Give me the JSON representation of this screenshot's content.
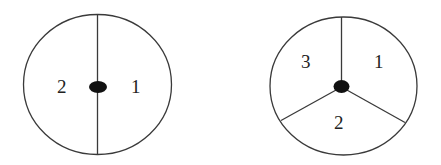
{
  "diagrams": [
    {
      "name": "two-sector-circle",
      "sectors": [
        {
          "label": "1"
        },
        {
          "label": "2"
        }
      ]
    },
    {
      "name": "three-sector-circle",
      "sectors": [
        {
          "label": "1"
        },
        {
          "label": "2"
        },
        {
          "label": "3"
        }
      ]
    }
  ],
  "colors": {
    "stroke": "#3a3a3a",
    "pivot": "#111111",
    "background": "#ffffff"
  }
}
